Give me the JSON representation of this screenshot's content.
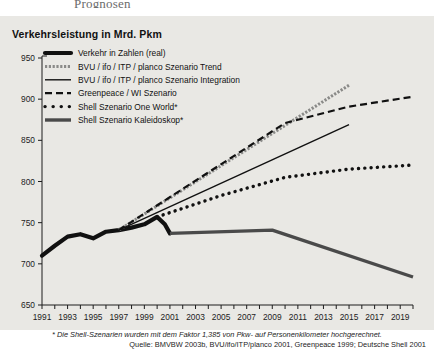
{
  "page": {
    "top_heading": "Prognosen",
    "panel_bg": "#e9e8e4"
  },
  "chart_title": "Verkehrsleistung in Mrd. Pkm",
  "footnotes": {
    "note": "* Die Shell-Szenarien wurden mit dem Faktor 1,385 von Pkw- auf Personenkilometer hochgerechnet.",
    "source": "Quelle: BMVBW 2003b, BVU/ifo/ITP/planco 2001, Greenpeace 1999; Deutsche Shell 2001"
  },
  "legend": {
    "items": [
      {
        "label": "Verkehr in Zahlen (real)",
        "style": "thick-solid",
        "color": "#111111"
      },
      {
        "label": "BVU / ifo / ITP / planco Szenario Trend",
        "style": "stipple",
        "color": "#8a8a88"
      },
      {
        "label": "BVU / ifo / ITP / planco Szenario Integration",
        "style": "solid",
        "color": "#111111"
      },
      {
        "label": "Greenpeace / WI Szenario",
        "style": "dashed",
        "color": "#111111"
      },
      {
        "label": "Shell Szenario One World*",
        "style": "dotted",
        "color": "#111111"
      },
      {
        "label": "Shell Szenario Kaleidoskop*",
        "style": "thick-gray",
        "color": "#4a4a4a"
      }
    ]
  },
  "chart_data": {
    "type": "line",
    "title": "Verkehrsleistung in Mrd. Pkm",
    "xlabel": "",
    "ylabel": "Verkehrsleistung in Mrd. Pkm",
    "xlim": [
      1991,
      2020
    ],
    "ylim": [
      650,
      950
    ],
    "yticks": [
      650,
      700,
      750,
      800,
      850,
      900,
      950
    ],
    "xticks": [
      1991,
      1993,
      1995,
      1997,
      1999,
      2001,
      2003,
      2005,
      2007,
      2009,
      2011,
      2013,
      2015,
      2017,
      2019
    ],
    "grid": false,
    "legend_position": "upper-left-inside",
    "series": [
      {
        "name": "Verkehr in Zahlen (real)",
        "style": "thick-solid",
        "color": "#111111",
        "points": [
          [
            1991,
            710
          ],
          [
            1992,
            722
          ],
          [
            1993,
            733
          ],
          [
            1994,
            736
          ],
          [
            1995,
            731
          ],
          [
            1996,
            739
          ],
          [
            1997,
            741
          ],
          [
            1998,
            744
          ],
          [
            1999,
            748
          ],
          [
            2000,
            757
          ],
          [
            2000.6,
            748
          ],
          [
            2001,
            737
          ]
        ]
      },
      {
        "name": "BVU / ifo / ITP / planco Szenario Trend",
        "style": "stipple",
        "color": "#8a8a88",
        "points": [
          [
            1997,
            741
          ],
          [
            2015,
            917
          ]
        ]
      },
      {
        "name": "BVU / ifo / ITP / planco Szenario Integration",
        "style": "solid",
        "color": "#111111",
        "points": [
          [
            1997,
            741
          ],
          [
            2015,
            869
          ]
        ]
      },
      {
        "name": "Greenpeace / WI Szenario",
        "style": "dashed",
        "color": "#111111",
        "points": [
          [
            1997,
            741
          ],
          [
            2010,
            871
          ],
          [
            2015,
            891
          ],
          [
            2020,
            903
          ]
        ]
      },
      {
        "name": "Shell Szenario One World*",
        "style": "dotted",
        "color": "#111111",
        "points": [
          [
            2000,
            757
          ],
          [
            2005,
            783
          ],
          [
            2010,
            805
          ],
          [
            2015,
            815
          ],
          [
            2020,
            820
          ]
        ]
      },
      {
        "name": "Shell Szenario Kaleidoskop*",
        "style": "thick-gray",
        "color": "#4a4a4a",
        "points": [
          [
            2001,
            737
          ],
          [
            2009,
            741
          ],
          [
            2020,
            684
          ]
        ]
      }
    ]
  }
}
